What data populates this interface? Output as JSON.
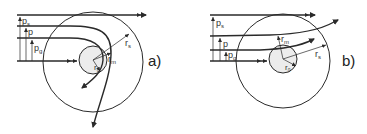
{
  "figure": {
    "panels": [
      {
        "id": "a",
        "label": "a)",
        "description": "Trajectories deflected around central body, captured/scattered",
        "labels": {
          "p_s": "p",
          "p_s_sub": "s",
          "p": "p",
          "p_g": "p",
          "p_g_sub": "g",
          "r_s": "r",
          "r_s_sub": "s",
          "r_m": "r",
          "r_m_sub": "m",
          "r_0": "r",
          "r_0_sub": "0"
        }
      },
      {
        "id": "b",
        "label": "b)",
        "description": "Trajectories weakly deflected by central body",
        "labels": {
          "p_s": "p",
          "p_s_sub": "s",
          "p": "p",
          "p_g": "p",
          "p_g_sub": "g",
          "r_s": "r",
          "r_s_sub": "s",
          "r_m": "r",
          "r_m_sub": "m",
          "r_0": "r",
          "r_0_sub": "0"
        }
      }
    ],
    "colors": {
      "line": "#2a2a2a",
      "inner_fill": "#ececec"
    }
  }
}
